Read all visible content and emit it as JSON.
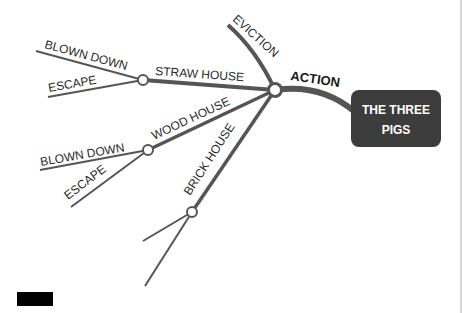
{
  "diagram": {
    "type": "mind-map",
    "central_topic": {
      "line1": "THE THREE",
      "line2": "PIGS"
    },
    "main_branch": "ACTION",
    "branches": [
      {
        "label": "EVICTION"
      },
      {
        "label": "STRAW HOUSE",
        "children": [
          "BLOWN DOWN",
          "ESCAPE"
        ]
      },
      {
        "label": "WOOD HOUSE",
        "children": [
          "BLOWN DOWN",
          "ESCAPE"
        ]
      },
      {
        "label": "BRICK HOUSE",
        "children": [
          "",
          ""
        ]
      }
    ],
    "colors": {
      "line": "#555555",
      "box": "#3c3c3c",
      "box_text": "#ffffff",
      "text": "#2a2a2a"
    }
  }
}
